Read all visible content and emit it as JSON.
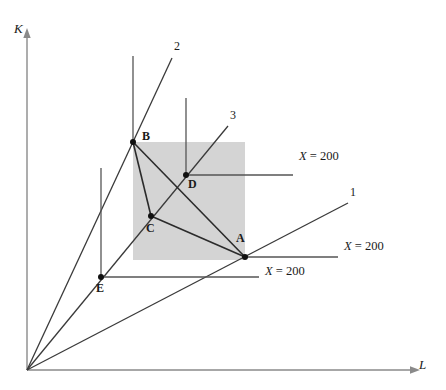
{
  "figure": {
    "axes": {
      "y_label": "K",
      "x_label": "L",
      "origin": [
        27,
        370
      ],
      "y_axis_top": [
        27,
        30
      ],
      "x_axis_right": [
        420,
        370
      ]
    },
    "colors": {
      "line": "#3a3a3a",
      "shade": "#d4d4d4",
      "text": "#1a1a1a",
      "background": "#ffffff"
    },
    "rays": [
      {
        "id": "ray-1",
        "label": "1",
        "from": [
          27,
          370
        ],
        "to": [
          348,
          203
        ],
        "label_pos": [
          350,
          186
        ]
      },
      {
        "id": "ray-2",
        "label": "2",
        "from": [
          27,
          370
        ],
        "to": [
          172,
          58
        ],
        "label_pos": [
          174,
          40
        ]
      },
      {
        "id": "ray-3",
        "label": "3",
        "from": [
          186,
          175
        ],
        "to": [
          228,
          126
        ],
        "label_pos": [
          230,
          109
        ]
      }
    ],
    "points": [
      {
        "id": "point-A",
        "label": "A",
        "x": 245,
        "y": 257,
        "label_pos": [
          236,
          232
        ]
      },
      {
        "id": "point-B",
        "label": "B",
        "x": 133,
        "y": 142,
        "label_pos": [
          142,
          130
        ]
      },
      {
        "id": "point-C",
        "label": "C",
        "x": 151,
        "y": 216,
        "label_pos": [
          146,
          222
        ]
      },
      {
        "id": "point-D",
        "label": "D",
        "x": 186,
        "y": 175,
        "label_pos": [
          188,
          178
        ]
      },
      {
        "id": "point-E",
        "label": "E",
        "x": 101,
        "y": 277,
        "label_pos": [
          96,
          282
        ]
      }
    ],
    "isoquant_labels": [
      {
        "id": "isoquant-label-top",
        "var": "X",
        "eq": " = 200",
        "x": 299,
        "y": 157
      },
      {
        "id": "isoquant-label-middle",
        "var": "X",
        "eq": " = 200",
        "x": 344,
        "y": 247
      },
      {
        "id": "isoquant-label-bottom",
        "var": "X",
        "eq": " = 200",
        "x": 265,
        "y": 272
      }
    ],
    "isoquant_segments": [
      {
        "id": "iso-seg-top",
        "from": [
          186,
          175
        ],
        "to": [
          293,
          175
        ]
      },
      {
        "id": "iso-seg-middle",
        "from": [
          245,
          257
        ],
        "to": [
          338,
          257
        ]
      },
      {
        "id": "iso-seg-bottom",
        "from": [
          101,
          277
        ],
        "to": [
          259,
          277
        ]
      }
    ],
    "vertical_segments": [
      {
        "id": "vline-above-B",
        "from": [
          133,
          56
        ],
        "to": [
          133,
          142
        ]
      },
      {
        "id": "vline-above-D",
        "from": [
          186,
          98
        ],
        "to": [
          186,
          175
        ]
      },
      {
        "id": "vline-above-E",
        "from": [
          101,
          168
        ],
        "to": [
          101,
          277
        ]
      }
    ],
    "shade_rect": {
      "x": 133,
      "y": 142,
      "width": 112,
      "height": 118
    },
    "triangle_BCA": [
      [
        133,
        142
      ],
      [
        151,
        216
      ],
      [
        245,
        257
      ]
    ],
    "edges": [
      {
        "id": "edge-B-A",
        "from": [
          133,
          142
        ],
        "to": [
          245,
          257
        ]
      },
      {
        "id": "edge-B-C",
        "from": [
          133,
          142
        ],
        "to": [
          151,
          216
        ]
      },
      {
        "id": "edge-C-A",
        "from": [
          151,
          216
        ],
        "to": [
          245,
          257
        ]
      }
    ]
  }
}
